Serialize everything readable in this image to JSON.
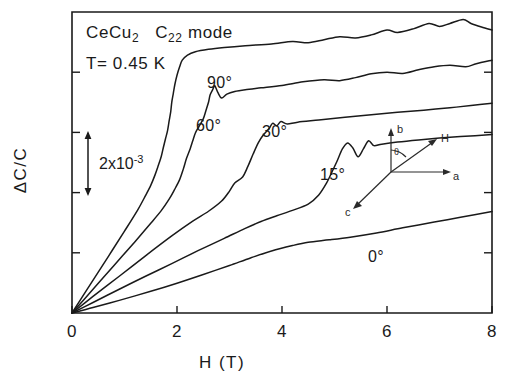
{
  "chart_data": {
    "type": "line",
    "title": "",
    "sample": "CeCu2",
    "sample_main": "CeCu",
    "sample_sub": "2",
    "mode_main": "C",
    "mode_sub": "22",
    "mode_tail": " mode",
    "temperature": "T= 0.45 K",
    "xlabel": "H  (T)",
    "ylabel": "ΔC/C",
    "xlim": [
      0,
      8
    ],
    "xticks": [
      0,
      2,
      4,
      6,
      8
    ],
    "xtick_labels": [
      "0",
      "2",
      "4",
      "6",
      "8"
    ],
    "ylim": [
      0,
      1
    ],
    "ytick_count": 4,
    "ytick_labels": [],
    "grid": false,
    "legend": "inline-curve-labels",
    "scale_bar": {
      "label_main": "2x10",
      "label_sup": "-3",
      "value": 0.002,
      "units": "ΔC/C"
    },
    "series": [
      {
        "name": "0°",
        "label": "0°",
        "points": [
          [
            0,
            0
          ],
          [
            0.4,
            0.018
          ],
          [
            0.9,
            0.042
          ],
          [
            1.5,
            0.072
          ],
          [
            2.0,
            0.099
          ],
          [
            2.5,
            0.128
          ],
          [
            3.0,
            0.158
          ],
          [
            3.4,
            0.183
          ],
          [
            3.8,
            0.206
          ],
          [
            4.2,
            0.224
          ],
          [
            4.5,
            0.235
          ],
          [
            4.9,
            0.243
          ],
          [
            5.3,
            0.252
          ],
          [
            5.8,
            0.266
          ],
          [
            6.3,
            0.283
          ],
          [
            6.9,
            0.302
          ],
          [
            7.4,
            0.318
          ],
          [
            8.0,
            0.337
          ]
        ]
      },
      {
        "name": "15°",
        "label": "15°",
        "points": [
          [
            0,
            0
          ],
          [
            0.4,
            0.035
          ],
          [
            0.9,
            0.079
          ],
          [
            1.4,
            0.122
          ],
          [
            1.9,
            0.164
          ],
          [
            2.4,
            0.207
          ],
          [
            2.9,
            0.248
          ],
          [
            3.3,
            0.281
          ],
          [
            3.6,
            0.304
          ],
          [
            3.9,
            0.323
          ],
          [
            4.2,
            0.341
          ],
          [
            4.5,
            0.362
          ],
          [
            4.7,
            0.392
          ],
          [
            4.85,
            0.432
          ],
          [
            4.95,
            0.468
          ],
          [
            5.05,
            0.505
          ],
          [
            5.15,
            0.545
          ],
          [
            5.25,
            0.565
          ],
          [
            5.35,
            0.548
          ],
          [
            5.45,
            0.519
          ],
          [
            5.55,
            0.545
          ],
          [
            5.65,
            0.572
          ],
          [
            5.75,
            0.556
          ],
          [
            5.9,
            0.561
          ],
          [
            6.2,
            0.568
          ],
          [
            6.6,
            0.575
          ],
          [
            7.0,
            0.581
          ],
          [
            7.4,
            0.586
          ],
          [
            8.0,
            0.593
          ]
        ]
      },
      {
        "name": "30°",
        "label": "30°",
        "points": [
          [
            0,
            0
          ],
          [
            0.4,
            0.055
          ],
          [
            0.9,
            0.122
          ],
          [
            1.4,
            0.19
          ],
          [
            1.9,
            0.256
          ],
          [
            2.3,
            0.305
          ],
          [
            2.6,
            0.338
          ],
          [
            2.85,
            0.372
          ],
          [
            3.0,
            0.405
          ],
          [
            3.1,
            0.432
          ],
          [
            3.25,
            0.452
          ],
          [
            3.35,
            0.487
          ],
          [
            3.45,
            0.528
          ],
          [
            3.55,
            0.566
          ],
          [
            3.65,
            0.593
          ],
          [
            3.75,
            0.612
          ],
          [
            3.82,
            0.63
          ],
          [
            3.9,
            0.622
          ],
          [
            3.98,
            0.636
          ],
          [
            4.1,
            0.628
          ],
          [
            4.3,
            0.634
          ],
          [
            4.7,
            0.641
          ],
          [
            5.2,
            0.65
          ],
          [
            5.7,
            0.659
          ],
          [
            6.2,
            0.667
          ],
          [
            6.7,
            0.674
          ],
          [
            7.2,
            0.682
          ],
          [
            7.6,
            0.689
          ],
          [
            8.0,
            0.697
          ]
        ]
      },
      {
        "name": "60°",
        "label": "60°",
        "points": [
          [
            0,
            0
          ],
          [
            0.35,
            0.069
          ],
          [
            0.8,
            0.158
          ],
          [
            1.2,
            0.237
          ],
          [
            1.5,
            0.298
          ],
          [
            1.7,
            0.34
          ],
          [
            1.85,
            0.378
          ],
          [
            1.95,
            0.409
          ],
          [
            2.05,
            0.443
          ],
          [
            2.12,
            0.478
          ],
          [
            2.18,
            0.513
          ],
          [
            2.25,
            0.545
          ],
          [
            2.3,
            0.572
          ],
          [
            2.35,
            0.598
          ],
          [
            2.42,
            0.62
          ],
          [
            2.5,
            0.645
          ],
          [
            2.55,
            0.672
          ],
          [
            2.6,
            0.7
          ],
          [
            2.63,
            0.724
          ],
          [
            2.68,
            0.742
          ],
          [
            2.72,
            0.755
          ],
          [
            2.78,
            0.732
          ],
          [
            2.85,
            0.714
          ],
          [
            2.95,
            0.727
          ],
          [
            3.1,
            0.736
          ],
          [
            3.3,
            0.742
          ],
          [
            3.6,
            0.748
          ],
          [
            4.0,
            0.756
          ],
          [
            4.4,
            0.768
          ],
          [
            4.8,
            0.775
          ],
          [
            5.1,
            0.772
          ],
          [
            5.4,
            0.782
          ],
          [
            5.7,
            0.795
          ],
          [
            6.0,
            0.8
          ],
          [
            6.3,
            0.796
          ],
          [
            6.6,
            0.808
          ],
          [
            6.9,
            0.818
          ],
          [
            7.2,
            0.823
          ],
          [
            7.5,
            0.818
          ],
          [
            7.7,
            0.828
          ],
          [
            8.0,
            0.84
          ]
        ]
      },
      {
        "name": "90°",
        "label": "90°",
        "points": [
          [
            0,
            0
          ],
          [
            0.3,
            0.082
          ],
          [
            0.7,
            0.19
          ],
          [
            1.0,
            0.272
          ],
          [
            1.25,
            0.342
          ],
          [
            1.4,
            0.39
          ],
          [
            1.5,
            0.424
          ],
          [
            1.58,
            0.458
          ],
          [
            1.64,
            0.488
          ],
          [
            1.7,
            0.52
          ],
          [
            1.74,
            0.55
          ],
          [
            1.78,
            0.578
          ],
          [
            1.82,
            0.606
          ],
          [
            1.85,
            0.638
          ],
          [
            1.88,
            0.668
          ],
          [
            1.9,
            0.7
          ],
          [
            1.93,
            0.73
          ],
          [
            1.96,
            0.76
          ],
          [
            2.0,
            0.79
          ],
          [
            2.05,
            0.818
          ],
          [
            2.1,
            0.84
          ],
          [
            2.2,
            0.857
          ],
          [
            2.35,
            0.868
          ],
          [
            2.6,
            0.876
          ],
          [
            2.9,
            0.882
          ],
          [
            3.3,
            0.888
          ],
          [
            3.8,
            0.894
          ],
          [
            4.2,
            0.902
          ],
          [
            4.5,
            0.898
          ],
          [
            4.8,
            0.908
          ],
          [
            5.1,
            0.918
          ],
          [
            5.4,
            0.914
          ],
          [
            5.7,
            0.924
          ],
          [
            6.0,
            0.94
          ],
          [
            6.2,
            0.932
          ],
          [
            6.5,
            0.944
          ],
          [
            6.8,
            0.962
          ],
          [
            7.0,
            0.952
          ],
          [
            7.2,
            0.962
          ],
          [
            7.45,
            0.975
          ],
          [
            7.6,
            0.962
          ],
          [
            7.8,
            0.95
          ],
          [
            8.0,
            0.94
          ]
        ]
      }
    ]
  },
  "annotations": {
    "curve_labels": [
      {
        "text": "90°",
        "x": 207,
        "y": 88
      },
      {
        "text": "60°",
        "x": 196,
        "y": 131
      },
      {
        "text": "30°",
        "x": 262,
        "y": 137
      },
      {
        "text": "15°",
        "x": 320,
        "y": 180
      },
      {
        "text": "0°",
        "x": 368,
        "y": 262
      }
    ]
  },
  "inset": {
    "name": "crystal-axis-orientation",
    "axes": [
      {
        "label": "b",
        "direction": "up"
      },
      {
        "label": "H",
        "direction": "up-right"
      },
      {
        "label": "a",
        "direction": "right"
      },
      {
        "label": "c",
        "direction": "down-left"
      }
    ],
    "angle_symbol": "θ"
  }
}
